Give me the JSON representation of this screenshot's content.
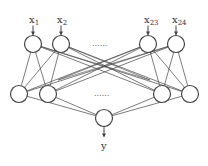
{
  "diagram": {
    "type": "neural-network",
    "colors": {
      "stroke": "#444444",
      "background": "#ffffff",
      "text": "#333333"
    },
    "input_layer": {
      "nodes": [
        {
          "id": "in1",
          "label": "x",
          "sub": "1",
          "cx": 33,
          "cy": 44
        },
        {
          "id": "in2",
          "label": "x",
          "sub": "2",
          "cx": 61,
          "cy": 44
        },
        {
          "id": "in23",
          "label": "x",
          "sub": "23",
          "cx": 148,
          "cy": 44
        },
        {
          "id": "in24",
          "label": "x",
          "sub": "24",
          "cx": 176,
          "cy": 44
        }
      ],
      "ellipsis": "......"
    },
    "hidden_layer": {
      "nodes": [
        {
          "id": "h1",
          "cx": 19,
          "cy": 94
        },
        {
          "id": "h2",
          "cx": 48,
          "cy": 94
        },
        {
          "id": "h3",
          "cx": 162,
          "cy": 94
        },
        {
          "id": "h4",
          "cx": 190,
          "cy": 94
        }
      ],
      "ellipsis": "......"
    },
    "output_layer": {
      "nodes": [
        {
          "id": "out",
          "label": "y",
          "cx": 104,
          "cy": 118
        }
      ]
    },
    "node_radius": 8.5
  }
}
